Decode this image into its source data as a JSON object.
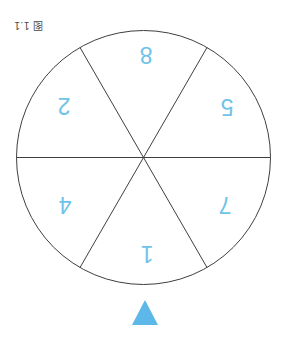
{
  "figure": {
    "label": "图 1.1",
    "rotation_deg": 180
  },
  "canvas": {
    "width": 287,
    "height": 343,
    "background": "#ffffff"
  },
  "wheel": {
    "center_x": 143.5,
    "center_y": 157.5,
    "radius": 127,
    "stroke_color": "#3f3f3f",
    "stroke_width": 1,
    "fill": "#ffffff",
    "sector_count": 6,
    "spoke_angles_deg": [
      0,
      60,
      120
    ],
    "number_color": "#6FC3E8",
    "numbers_rotation_deg": 180,
    "sectors": [
      {
        "name": "top",
        "label": "8",
        "center_angle_deg": 90,
        "x": 146,
        "y": 55
      },
      {
        "name": "upper-right",
        "label": "5",
        "center_angle_deg": 30,
        "x": 227,
        "y": 107
      },
      {
        "name": "lower-right",
        "label": "7",
        "center_angle_deg": 330,
        "x": 225,
        "y": 205
      },
      {
        "name": "bottom",
        "label": "1",
        "center_angle_deg": 270,
        "x": 147,
        "y": 254
      },
      {
        "name": "lower-left",
        "label": "4",
        "center_angle_deg": 210,
        "x": 65,
        "y": 205
      },
      {
        "name": "upper-left",
        "label": "2",
        "center_angle_deg": 150,
        "x": 64,
        "y": 106
      }
    ]
  },
  "pointer": {
    "color": "#5BB8E8",
    "direction": "up",
    "apex_x": 145,
    "apex_y": 300,
    "base_y": 325,
    "half_width": 13
  }
}
